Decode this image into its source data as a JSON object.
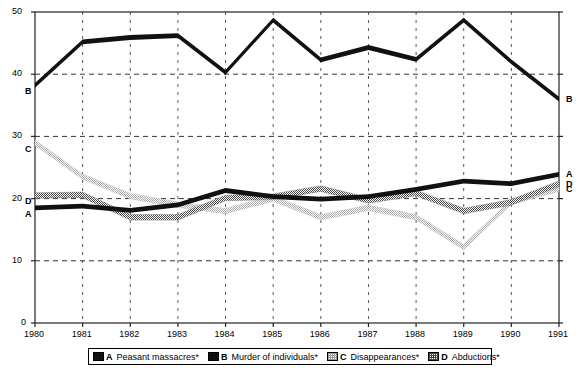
{
  "chart_data": {
    "type": "line",
    "title": "",
    "xlabel": "",
    "ylabel": "",
    "x": [
      1980,
      1981,
      1982,
      1983,
      1984,
      1985,
      1986,
      1987,
      1988,
      1989,
      1990,
      1991
    ],
    "xtick_labels": [
      "1980",
      "1981",
      "1982",
      "1983",
      "1984",
      "1985",
      "1986",
      "1987",
      "1988",
      "1989",
      "1990",
      "1991"
    ],
    "ytick_labels": [
      "0",
      "10",
      "20",
      "30",
      "40",
      "50"
    ],
    "yticks": [
      0,
      10,
      20,
      30,
      40,
      50
    ],
    "ylim": [
      0,
      50
    ],
    "grid": "dashed-both",
    "legend_position": "bottom",
    "series": [
      {
        "key": "A",
        "name": "Peasant massacres*",
        "style": "solid-black",
        "color": "#111111",
        "values": [
          18.5,
          18.8,
          18.1,
          19.0,
          21.3,
          20.3,
          19.9,
          20.3,
          21.5,
          22.8,
          22.4,
          23.9
        ],
        "left_label": "A",
        "right_label": "A"
      },
      {
        "key": "B",
        "name": "Murder of individuals*",
        "style": "solid-black",
        "color": "#111111",
        "values": [
          38.2,
          45.2,
          45.9,
          46.2,
          40.3,
          48.7,
          42.3,
          44.3,
          42.4,
          48.7,
          42.0,
          36.0
        ],
        "left_label": "B",
        "right_label": "B"
      },
      {
        "key": "C",
        "name": "Disappearances*",
        "style": "light-stipple",
        "color": "#b5b5b5",
        "values": [
          29.0,
          23.5,
          20.4,
          19.0,
          18.0,
          20.0,
          17.0,
          18.5,
          17.0,
          12.2,
          19.5,
          21.6
        ],
        "left_label": "C",
        "right_label": "C"
      },
      {
        "key": "D",
        "name": "Abductions*",
        "style": "dark-stipple",
        "color": "#5a5a5a",
        "values": [
          20.5,
          20.6,
          17.0,
          17.0,
          20.1,
          20.3,
          21.6,
          19.7,
          20.9,
          18.0,
          19.4,
          22.4
        ],
        "left_label": "D",
        "right_label": "D"
      }
    ]
  },
  "legend": {
    "entries": [
      {
        "key": "A",
        "label": "Peasant massacres*"
      },
      {
        "key": "B",
        "label": "Murder of individuals*"
      },
      {
        "key": "C",
        "label": "Disappearances*"
      },
      {
        "key": "D",
        "label": "Abductions*"
      }
    ]
  },
  "axis": {
    "y_labels": [
      "50",
      "40",
      "30",
      "20",
      "10",
      "0"
    ],
    "x_labels": [
      "1980",
      "1981",
      "1982",
      "1983",
      "1984",
      "1985",
      "1986",
      "1987",
      "1988",
      "1989",
      "1990",
      "1991"
    ]
  },
  "edge_labels": {
    "left": [
      {
        "key": "B",
        "value": 38.2
      },
      {
        "key": "C",
        "value": 29.0
      },
      {
        "key": "D",
        "value": 20.5
      },
      {
        "key": "A",
        "value": 18.5
      }
    ],
    "right": [
      {
        "key": "B",
        "value": 36.0
      },
      {
        "key": "A",
        "value": 23.9
      },
      {
        "key": "D",
        "value": 22.4
      },
      {
        "key": "C",
        "value": 21.6
      }
    ]
  }
}
